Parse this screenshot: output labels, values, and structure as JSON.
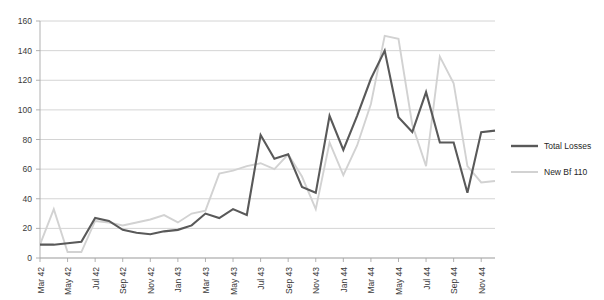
{
  "chart_data": {
    "type": "line",
    "title": "",
    "subtitle": "",
    "xlabel": "",
    "ylabel": "",
    "ylim": [
      0,
      160
    ],
    "ytick_step": 20,
    "grid": true,
    "legend_position": "right",
    "yticks": [
      "0",
      "20",
      "40",
      "60",
      "80",
      "100",
      "120",
      "140",
      "160"
    ],
    "categories": [
      "Mar 42",
      "Apr 42",
      "May 42",
      "Jun 42",
      "Jul 42",
      "Aug 42",
      "Sep 42",
      "Oct 42",
      "Nov 42",
      "Dec 42",
      "Jan 43",
      "Feb 43",
      "Mar 43",
      "Apr 43",
      "May 43",
      "Jun 43",
      "Jul 43",
      "Aug 43",
      "Sep 43",
      "Oct 43",
      "Nov 43",
      "Dec 43",
      "Jan 44",
      "Feb 44",
      "Mar 44",
      "Apr 44",
      "May 44",
      "Jun 44",
      "Jul 44",
      "Aug 44",
      "Sep 44",
      "Oct 44",
      "Nov 44",
      "Dec 44"
    ],
    "xtick_labels": [
      "Mar 42",
      "May 42",
      "Jul 42",
      "Sep 42",
      "Nov 42",
      "Jan 43",
      "Mar 43",
      "May 43",
      "Jul 43",
      "Sep 43",
      "Nov 43",
      "Jan 44",
      "Mar 44",
      "May 44",
      "Jul 44",
      "Sep 44",
      "Nov 44"
    ],
    "series": [
      {
        "name": "Total Losses",
        "color": "#595959",
        "values": [
          9,
          9,
          10,
          11,
          27,
          25,
          19,
          17,
          16,
          18,
          19,
          22,
          30,
          27,
          33,
          29,
          83,
          67,
          70,
          48,
          44,
          96,
          73,
          96,
          121,
          140,
          95,
          85,
          112,
          78,
          78,
          44,
          85,
          86
        ]
      },
      {
        "name": "New Bf 110",
        "color": "#d2d2d2",
        "values": [
          9,
          33,
          4,
          4,
          25,
          24,
          22,
          24,
          26,
          29,
          24,
          30,
          32,
          57,
          59,
          62,
          64,
          60,
          70,
          55,
          33,
          78,
          56,
          76,
          104,
          150,
          148,
          90,
          62,
          136,
          118,
          62,
          51,
          52
        ]
      }
    ]
  },
  "legend": {
    "items": [
      {
        "label": "Total Losses",
        "color": "#595959"
      },
      {
        "label": "New Bf 110",
        "color": "#d2d2d2"
      }
    ]
  }
}
